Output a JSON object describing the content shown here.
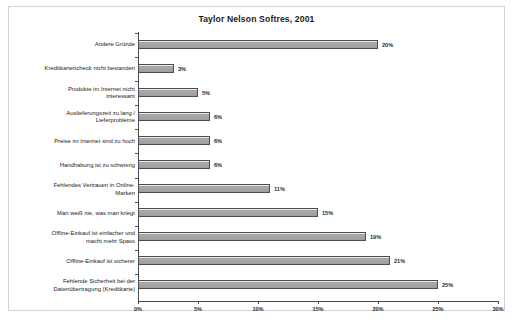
{
  "chart_data": {
    "type": "bar",
    "orientation": "horizontal",
    "title": "Taylor Nelson Softres, 2001",
    "xlabel": "",
    "ylabel": "",
    "xlim": [
      0,
      30
    ],
    "grid": false,
    "legend": null,
    "value_suffix": "%",
    "xticks": [
      "0%",
      "5%",
      "10%",
      "15%",
      "20%",
      "25%",
      "30%"
    ],
    "xtick_values": [
      0,
      5,
      10,
      15,
      20,
      25,
      30
    ],
    "categories": [
      "Andere Gründe",
      "Kreditkartencheck nicht bestanden",
      "Produkte im Internet nicht interessant",
      "Auslieferungszeit zu lang / Lieferprobleme",
      "Preise im Internet sind zu hoch",
      "Handhabung ist zu schwierig",
      "Fehlendes Vertrauen in Online-Marken",
      "Man weiß nie, was man kriegt",
      "Offline-Einkauf ist einfacher und macht mehr Spass",
      "Offline-Einkauf ist sicherer",
      "Fehlende Sicherheit bei der Datenübertragung (Kreditkarte)"
    ],
    "category_lines": [
      [
        "Andere Gründe"
      ],
      [
        "Kreditkartencheck nicht bestanden"
      ],
      [
        "Produkte im Internet nicht",
        "interessant"
      ],
      [
        "Auslieferungszeit zu lang /",
        "Lieferprobleme"
      ],
      [
        "Preise im Internet sind zu hoch"
      ],
      [
        "Handhabung ist zu schwierig"
      ],
      [
        "Fehlendes Vertrauen in Online-",
        "Marken"
      ],
      [
        "Man weiß nie, was man kriegt"
      ],
      [
        "Offline-Einkauf ist einfacher und",
        "macht mehr Spass"
      ],
      [
        "Offline-Einkauf ist sicherer"
      ],
      [
        "Fehlende Sicherheit bei der",
        "Datenübertragung (Kreditkarte)"
      ]
    ],
    "values": [
      20,
      3,
      5,
      6,
      6,
      6,
      11,
      15,
      19,
      21,
      25
    ],
    "value_labels": [
      "20%",
      "3%",
      "5%",
      "6%",
      "6%",
      "6%",
      "11%",
      "15%",
      "19%",
      "21%",
      "25%"
    ],
    "colors": {
      "bar_fill": "#a3a3a3",
      "bar_border": "#4d4d4d",
      "axis": "#4a4a4a",
      "text": "#232323",
      "frame": "#d2d2d2",
      "background": "#ffffff"
    }
  },
  "caption": ""
}
